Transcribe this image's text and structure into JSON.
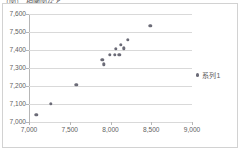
{
  "caption": "（図） 相関図など",
  "legend": {
    "position": "right",
    "marker_color": "#6b6b77",
    "entries": [
      "系列1"
    ]
  },
  "axes": {
    "y_ticks": [
      "7,000",
      "7,100",
      "7,200",
      "7,300",
      "7,400",
      "7,500",
      "7,600"
    ],
    "x_ticks": [
      "7,000",
      "7,500",
      "8,000",
      "8,500",
      "9,000"
    ]
  },
  "chart_data": {
    "type": "scatter",
    "title": "（図） 相関図など",
    "xlabel": "",
    "ylabel": "",
    "xlim": [
      7000,
      9000
    ],
    "ylim": [
      7000,
      7600
    ],
    "x_tick_step": 500,
    "y_tick_step": 100,
    "grid": true,
    "legend_position": "right",
    "series": [
      {
        "name": "系列1",
        "marker": "circle",
        "color": "#6b6b77",
        "points": [
          {
            "x": 7090,
            "y": 7040
          },
          {
            "x": 7265,
            "y": 7100
          },
          {
            "x": 7580,
            "y": 7205
          },
          {
            "x": 7900,
            "y": 7345
          },
          {
            "x": 7920,
            "y": 7320
          },
          {
            "x": 7990,
            "y": 7375
          },
          {
            "x": 8050,
            "y": 7375
          },
          {
            "x": 8065,
            "y": 7405
          },
          {
            "x": 8110,
            "y": 7375
          },
          {
            "x": 8130,
            "y": 7430
          },
          {
            "x": 8160,
            "y": 7410
          },
          {
            "x": 8215,
            "y": 7455
          },
          {
            "x": 8490,
            "y": 7535
          }
        ]
      }
    ]
  }
}
